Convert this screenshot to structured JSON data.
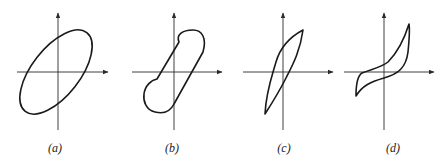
{
  "figure": {
    "panels": [
      {
        "id": "a",
        "label": "(a)",
        "shape": "tilted ellipse hysteresis loop"
      },
      {
        "id": "b",
        "label": "(b)",
        "shape": "pinched/capsule hysteresis loop"
      },
      {
        "id": "c",
        "label": "(c)",
        "shape": "narrow lens-shaped hysteresis loop"
      },
      {
        "id": "d",
        "label": "(d)",
        "shape": "S-shaped hysteresis loop"
      }
    ],
    "axes": "cartesian axes with arrows on positive x and y",
    "colors": {
      "stroke": "#1a1a1a",
      "background": "#ffffff"
    }
  }
}
